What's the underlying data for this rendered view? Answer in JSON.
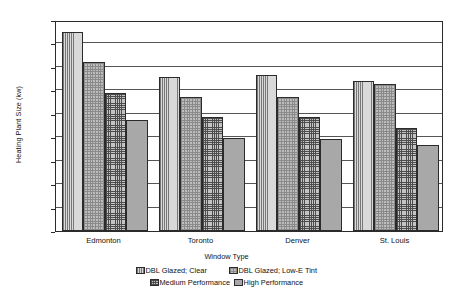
{
  "chart_data": {
    "type": "bar",
    "title": "",
    "xlabel": "Window Type",
    "ylabel": "Heating Plant Size (kw)",
    "categories": [
      "Edmonton",
      "Toronto",
      "Denver",
      "St. Louis"
    ],
    "ylim": [
      0,
      900
    ],
    "yticks": [
      0,
      100,
      200,
      300,
      400,
      500,
      600,
      700,
      800,
      900
    ],
    "ytick_labels": [
      "0",
      "100",
      "200",
      "300",
      "400",
      "500",
      "600",
      "700",
      "800",
      "900"
    ],
    "grid": true,
    "legend_position": "bottom",
    "series": [
      {
        "name": "DBL Glazed; Clear",
        "pattern": "vertical-lines",
        "values": [
          850,
          655,
          667,
          638
        ]
      },
      {
        "name": "DBL Glazed; Low-E Tint",
        "pattern": "fine-dots",
        "values": [
          723,
          573,
          571,
          627
        ]
      },
      {
        "name": "Medium Performance",
        "pattern": "cross-hatch",
        "values": [
          590,
          488,
          486,
          438
        ]
      },
      {
        "name": "High Performance",
        "pattern": "solid-gray",
        "values": [
          472,
          395,
          392,
          367
        ]
      }
    ]
  },
  "colors": {
    "axis": "#2b2b2b",
    "gridline": "#555555",
    "background": "#ffffff",
    "pattern_vertical_lines": "#d9d9d9",
    "pattern_fine_dots": "#bdbdbd",
    "pattern_cross_hatch": "#c4c4c4",
    "pattern_solid_gray": "#a8a8a8"
  }
}
